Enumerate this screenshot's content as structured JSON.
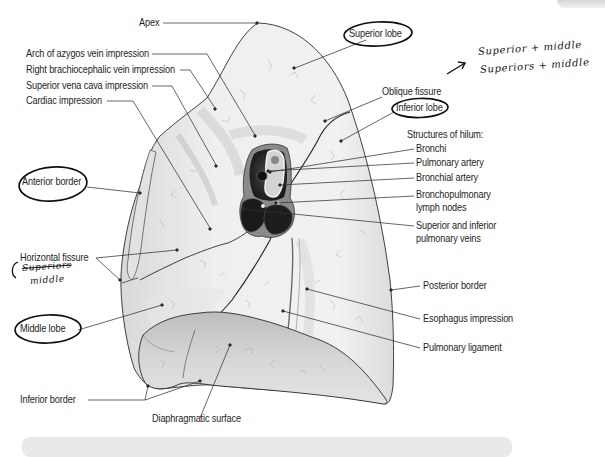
{
  "figure": {
    "labels": {
      "apex": "Apex",
      "arch_azygos": "Arch of azygos vein impression",
      "right_brachiocephalic": "Right brachiocephalic vein impression",
      "svc": "Superior vena cava impression",
      "cardiac": "Cardiac impression",
      "anterior_border": "Anterior border",
      "horizontal_fissure": "Horizontal fissure",
      "middle_lobe": "Middle lobe",
      "inferior_border": "Inferior border",
      "diaphragmatic_surface": "Diaphragmatic surface",
      "superior_lobe": "Superior lobe",
      "oblique_fissure": "Oblique fissure",
      "inferior_lobe": "Inferior lobe",
      "hilum_heading": "Structures of hilum:",
      "bronchi": "Bronchi",
      "pulmonary_artery": "Pulmonary artery",
      "bronchial_artery": "Bronchial artery",
      "lymph_nodes_1": "Bronchopulmonary",
      "lymph_nodes_2": "lymph nodes",
      "pulm_veins_1": "Superior and inferior",
      "pulm_veins_2": "pulmonary veins",
      "posterior_border": "Posterior border",
      "esophagus": "Esophagus impression",
      "pulmonary_ligament": "Pulmonary ligament"
    },
    "circled_labels": [
      "Superior lobe",
      "Inferior lobe",
      "Anterior border",
      "Middle lobe"
    ],
    "handwritten_notes": {
      "top_right_line1": "Superior + middle",
      "top_right_line2": "Superiors + middle",
      "left_line1": "Superiors",
      "left_line2": "middle"
    }
  },
  "colors": {
    "lung_fill": "#ececec",
    "lung_shade": "#cfcfcf",
    "diaphragm_fill": "#c9c9c9",
    "hilum_dark": "#2a2a2a",
    "leader_line": "#333333",
    "ink": "#111111"
  }
}
